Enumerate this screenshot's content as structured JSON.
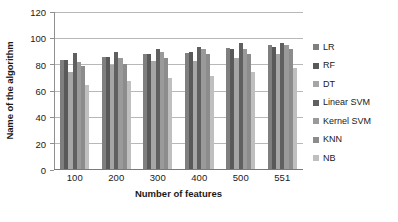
{
  "chart_data": {
    "type": "bar",
    "title": "",
    "xlabel": "Number of features",
    "ylabel": "Name of the algorithm",
    "categories": [
      "100",
      "200",
      "300",
      "400",
      "500",
      "551"
    ],
    "ylim": [
      0,
      120
    ],
    "yticks": [
      0,
      20,
      40,
      60,
      80,
      100,
      120
    ],
    "grid": true,
    "legend_position": "right",
    "series": [
      {
        "name": "LR",
        "color": "#7f7f7f",
        "values": [
          83,
          85,
          87,
          88,
          92,
          94
        ]
      },
      {
        "name": "RF",
        "color": "#595959",
        "values": [
          83,
          85,
          87,
          89,
          91,
          93
        ]
      },
      {
        "name": "DT",
        "color": "#a6a6a6",
        "values": [
          74,
          79,
          82,
          82,
          84,
          87
        ]
      },
      {
        "name": "Linear SVM",
        "color": "#606060",
        "values": [
          88,
          89,
          91,
          93,
          96,
          96
        ]
      },
      {
        "name": "Kernel SVM",
        "color": "#9a9a9a",
        "values": [
          81,
          84,
          89,
          91,
          91,
          94
        ]
      },
      {
        "name": "KNN",
        "color": "#8c8c8c",
        "values": [
          78,
          80,
          84,
          87,
          87,
          91
        ]
      },
      {
        "name": "NB",
        "color": "#bfbfbf",
        "values": [
          64,
          67,
          69,
          71,
          74,
          77
        ]
      }
    ]
  }
}
